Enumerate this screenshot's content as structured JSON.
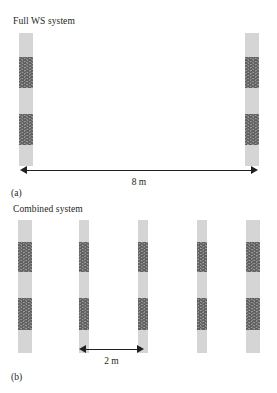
{
  "figure": {
    "background_color": "#ffffff",
    "ink_color": "#231f20",
    "light_segment_color": "#d5d5d5",
    "hatch_segment_color": "#9a9a9a",
    "hatch_line_color": "#5d5d5d"
  },
  "panel_a": {
    "title": "Full WS system",
    "caption": "(a)",
    "dimension": {
      "label": "8 m",
      "value": 8,
      "unit": "m"
    },
    "column_count": 2,
    "columns": [
      {
        "name": "wall-left",
        "x": 19,
        "width": 14,
        "top": 33,
        "height": 133,
        "segments": [
          {
            "type": "light",
            "top": 0,
            "height": 24
          },
          {
            "type": "hatch",
            "top": 24,
            "height": 31
          },
          {
            "type": "light",
            "top": 55,
            "height": 26
          },
          {
            "type": "hatch",
            "top": 81,
            "height": 31
          },
          {
            "type": "light",
            "top": 112,
            "height": 21
          }
        ]
      },
      {
        "name": "wall-right",
        "x": 245,
        "width": 14,
        "top": 33,
        "height": 133,
        "segments": [
          {
            "type": "light",
            "top": 0,
            "height": 24
          },
          {
            "type": "hatch",
            "top": 24,
            "height": 31
          },
          {
            "type": "light",
            "top": 55,
            "height": 26
          },
          {
            "type": "hatch",
            "top": 81,
            "height": 31
          },
          {
            "type": "light",
            "top": 112,
            "height": 21
          }
        ]
      }
    ]
  },
  "panel_b": {
    "title": "Combined system",
    "caption": "(b)",
    "dimension": {
      "label": "2 m",
      "value": 2,
      "unit": "m"
    },
    "column_count": 5,
    "columns": [
      {
        "name": "wall-1",
        "x": 18,
        "width": 14,
        "top": 220,
        "height": 133,
        "segments": [
          {
            "type": "light",
            "top": 0,
            "height": 22
          },
          {
            "type": "hatch",
            "top": 22,
            "height": 30
          },
          {
            "type": "light",
            "top": 52,
            "height": 26
          },
          {
            "type": "hatch",
            "top": 78,
            "height": 32
          },
          {
            "type": "light",
            "top": 110,
            "height": 23
          }
        ]
      },
      {
        "name": "wall-2",
        "x": 79,
        "width": 10,
        "top": 220,
        "height": 133,
        "segments": [
          {
            "type": "light",
            "top": 0,
            "height": 22
          },
          {
            "type": "hatch",
            "top": 22,
            "height": 30
          },
          {
            "type": "light",
            "top": 52,
            "height": 26
          },
          {
            "type": "hatch",
            "top": 78,
            "height": 32
          },
          {
            "type": "light",
            "top": 110,
            "height": 23
          }
        ]
      },
      {
        "name": "wall-3",
        "x": 138,
        "width": 10,
        "top": 220,
        "height": 133,
        "segments": [
          {
            "type": "light",
            "top": 0,
            "height": 22
          },
          {
            "type": "hatch",
            "top": 22,
            "height": 30
          },
          {
            "type": "light",
            "top": 52,
            "height": 26
          },
          {
            "type": "hatch",
            "top": 78,
            "height": 32
          },
          {
            "type": "light",
            "top": 110,
            "height": 23
          }
        ]
      },
      {
        "name": "wall-4",
        "x": 197,
        "width": 10,
        "top": 220,
        "height": 133,
        "segments": [
          {
            "type": "light",
            "top": 0,
            "height": 22
          },
          {
            "type": "hatch",
            "top": 22,
            "height": 30
          },
          {
            "type": "light",
            "top": 52,
            "height": 26
          },
          {
            "type": "hatch",
            "top": 78,
            "height": 32
          },
          {
            "type": "light",
            "top": 110,
            "height": 23
          }
        ]
      },
      {
        "name": "wall-5",
        "x": 246,
        "width": 14,
        "top": 220,
        "height": 133,
        "segments": [
          {
            "type": "light",
            "top": 0,
            "height": 22
          },
          {
            "type": "hatch",
            "top": 22,
            "height": 30
          },
          {
            "type": "light",
            "top": 52,
            "height": 26
          },
          {
            "type": "hatch",
            "top": 78,
            "height": 32
          },
          {
            "type": "light",
            "top": 110,
            "height": 23
          }
        ]
      }
    ]
  }
}
